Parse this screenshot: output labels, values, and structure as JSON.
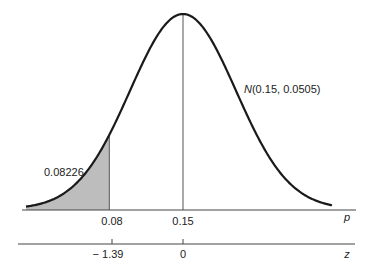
{
  "figure": {
    "distribution_label_prefix": "N",
    "distribution_label_params": "(0.15, 0.0505)",
    "shaded_area_label": "0.08226",
    "p_axis": {
      "name": "p",
      "ticks": [
        {
          "value": 0.08,
          "label": "0.08"
        },
        {
          "value": 0.15,
          "label": "0.15"
        }
      ]
    },
    "z_axis": {
      "name": "z",
      "ticks": [
        {
          "value": -1.39,
          "label": "− 1.39"
        },
        {
          "value": 0,
          "label": "0"
        }
      ]
    },
    "colors": {
      "curve": "#1a1a1a",
      "shade": "#bdbdbd",
      "axis": "#444444"
    }
  },
  "chart_data": {
    "type": "area",
    "title": "",
    "distribution": "normal",
    "mean": 0.15,
    "std": 0.0505,
    "shaded_region": {
      "from": "-inf",
      "to": 0.08,
      "area": 0.08226
    },
    "annotations": [
      "N(0.15, 0.0505)",
      "0.08226"
    ],
    "x_axes": [
      {
        "name": "p",
        "tick_labels": [
          "0.08",
          "0.15"
        ],
        "tick_values": [
          0.08,
          0.15
        ]
      },
      {
        "name": "z",
        "tick_labels": [
          "-1.39",
          "0"
        ],
        "tick_values": [
          -1.39,
          0
        ]
      }
    ],
    "grid": false,
    "legend": null
  }
}
